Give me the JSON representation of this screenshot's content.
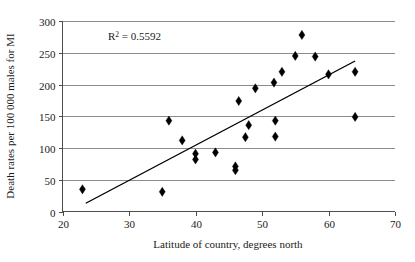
{
  "chart_data": {
    "type": "scatter",
    "title": "",
    "xlabel": "Latitude of country, degrees north",
    "ylabel": "Death rates per 100 000 males for MI",
    "xlim": [
      20,
      70
    ],
    "ylim": [
      0,
      300
    ],
    "xticks": [
      20,
      30,
      40,
      50,
      60,
      70
    ],
    "yticks": [
      0,
      50,
      100,
      150,
      200,
      250,
      300
    ],
    "xtick_labels": [
      "20",
      "30",
      "40",
      "50",
      "60",
      "70"
    ],
    "ytick_labels": [
      "0",
      "50",
      "100",
      "150",
      "200",
      "250",
      "300"
    ],
    "grid": "horizontal",
    "legend": "none",
    "marker": "diamond",
    "marker_color": "#000000",
    "gridline_color": "#8c8c8c",
    "axis_color": "#4d4d4d",
    "annotations": [
      {
        "name": "r-squared",
        "text": "R2 = 0.5592",
        "prefix": "R",
        "superscript": "2",
        "suffix": " = 0.5592",
        "value": 0.5592,
        "x": 31.5,
        "y": 272
      }
    ],
    "points": [
      {
        "x": 23.0,
        "y": 35
      },
      {
        "x": 35.0,
        "y": 31
      },
      {
        "x": 36.0,
        "y": 143
      },
      {
        "x": 38.0,
        "y": 112
      },
      {
        "x": 40.0,
        "y": 91
      },
      {
        "x": 40.0,
        "y": 82
      },
      {
        "x": 43.0,
        "y": 93
      },
      {
        "x": 46.0,
        "y": 71
      },
      {
        "x": 46.0,
        "y": 65
      },
      {
        "x": 46.5,
        "y": 174
      },
      {
        "x": 47.5,
        "y": 117
      },
      {
        "x": 48.0,
        "y": 136
      },
      {
        "x": 49.0,
        "y": 194
      },
      {
        "x": 51.8,
        "y": 203
      },
      {
        "x": 52.0,
        "y": 143
      },
      {
        "x": 52.0,
        "y": 118
      },
      {
        "x": 53.0,
        "y": 220
      },
      {
        "x": 55.0,
        "y": 245
      },
      {
        "x": 56.0,
        "y": 278
      },
      {
        "x": 58.0,
        "y": 244
      },
      {
        "x": 60.0,
        "y": 216
      },
      {
        "x": 64.0,
        "y": 220
      },
      {
        "x": 64.0,
        "y": 149
      }
    ],
    "trendline": {
      "name": "linear-fit",
      "x_start": 23.5,
      "y_start": 13,
      "x_end": 64.0,
      "y_end": 237,
      "color": "#000000"
    }
  }
}
